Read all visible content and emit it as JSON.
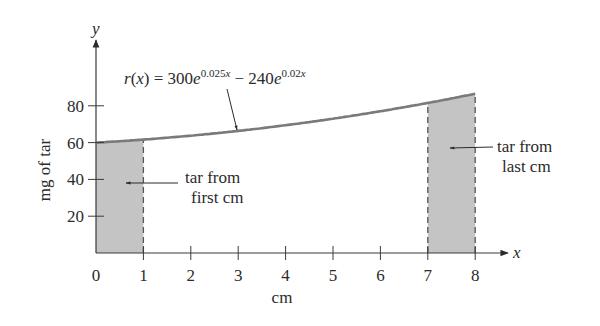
{
  "chart_data": {
    "type": "area",
    "title": "",
    "function_label": {
      "lhs": "r(x) = 300e",
      "exp1": "0.025x",
      "mid": " − 240e",
      "exp2": "0.02x"
    },
    "xlabel": "cm",
    "ylabel": "mg of tar",
    "x_axis_symbol": "x",
    "y_axis_symbol": "y",
    "xlim": [
      0,
      8
    ],
    "ylim": [
      0,
      100
    ],
    "x_ticks": [
      0,
      1,
      2,
      3,
      4,
      5,
      6,
      7,
      8
    ],
    "y_ticks": [
      20,
      40,
      60,
      80
    ],
    "x": [
      0,
      1,
      2,
      3,
      4,
      5,
      6,
      7,
      8
    ],
    "values": [
      60,
      61.6,
      63.5,
      65.6,
      68.0,
      70.7,
      73.7,
      77.0,
      80.8
    ],
    "shaded_regions": [
      {
        "from": 0,
        "to": 1,
        "label": "tar from first cm"
      },
      {
        "from": 7,
        "to": 8,
        "label": "tar from last cm"
      }
    ],
    "grid": false
  },
  "annotations": {
    "first": [
      "tar from",
      "first cm"
    ],
    "last": [
      "tar from",
      "last cm"
    ]
  },
  "colors": {
    "curve": "#7a7a7a",
    "shade": "#c4c4c4",
    "axis": "#3a3a3a"
  }
}
